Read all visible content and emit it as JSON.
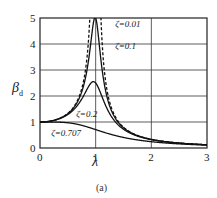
{
  "chart_data": {
    "type": "line",
    "title": "",
    "caption": "(a)",
    "xlabel": "λ",
    "ylabel": "β_d",
    "ylabel_main": "β",
    "ylabel_sub": "d",
    "xlim": [
      0,
      3
    ],
    "ylim": [
      0,
      5
    ],
    "xticks": [
      "0",
      "1",
      "2",
      "3"
    ],
    "yticks": [
      "0",
      "1",
      "2",
      "3",
      "4",
      "5"
    ],
    "grid": true,
    "formula": "β_d = 1 / sqrt((1-λ²)² + (2ζλ)²)",
    "series": [
      {
        "name": "ζ=0.01",
        "zeta": 0.01,
        "style": "dashed",
        "peak": 50
      },
      {
        "name": "ζ=0.1",
        "zeta": 0.1,
        "style": "solid",
        "peak": 5.0
      },
      {
        "name": "ζ=0.2",
        "zeta": 0.2,
        "style": "solid",
        "peak": 2.55
      },
      {
        "name": "ζ=0.707",
        "zeta": 0.707,
        "style": "solid",
        "peak": 1.0
      }
    ],
    "annotations": [
      {
        "text": "ζ=0.01",
        "x": 1.35,
        "y": 4.65
      },
      {
        "text": "ζ=0.1",
        "x": 1.35,
        "y": 3.8
      },
      {
        "text": "ζ=0.2",
        "x": 0.65,
        "y": 1.2
      },
      {
        "text": "ζ=0.707",
        "x": 0.2,
        "y": 0.45
      }
    ]
  }
}
